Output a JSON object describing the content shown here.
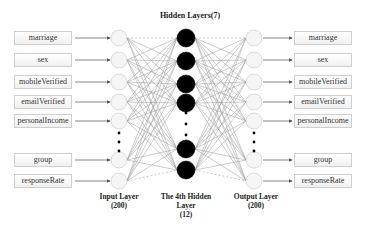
{
  "title": "Hidden Layers(7)",
  "input_features": [
    "marriage",
    "sex",
    "mobileVerified",
    "emailVerified",
    "personalIncome",
    "group",
    "responseRate"
  ],
  "output_features": [
    "marriage",
    "sex",
    "mobileVerified",
    "emailVerified",
    "personalIncome",
    "group",
    "responseRate"
  ],
  "layers": {
    "input": {
      "name": "Input Layer",
      "count": "(200)"
    },
    "hidden": {
      "name_line1": "The 4th Hidden",
      "name_line2": "Layer",
      "count": "(12)"
    },
    "output": {
      "name": "Output Layer",
      "count": "(200)"
    }
  },
  "colors": {
    "hidden_node": "#000000",
    "io_node": "#f4f4f4",
    "edge": "#888888"
  }
}
